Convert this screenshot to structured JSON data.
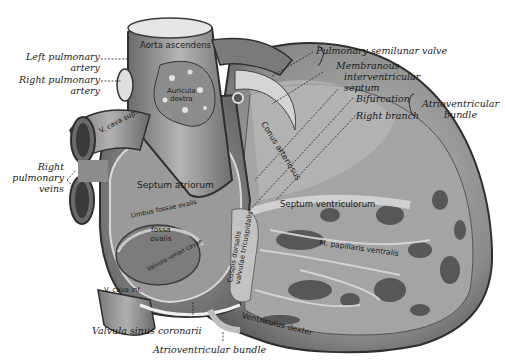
{
  "figure": {
    "colors": {
      "background": "#ffffff",
      "ink": "#1a1a1a",
      "tissue_light": "#c9c9c9",
      "tissue_mid": "#8e8e8e",
      "tissue_dark": "#3c3c3c"
    }
  },
  "external_labels": {
    "left_pulmonary_artery": [
      "Left pulmonary",
      "artery"
    ],
    "right_pulmonary_artery": [
      "Right pulmonary",
      "artery"
    ],
    "right_pulmonary_veins": [
      "Right",
      "pulmonary",
      "veins"
    ],
    "pulmonary_semilunar_valve": "Pulmonary semilunar valve",
    "membranous_interventricular_septum": [
      "Membranous",
      "interventricular",
      "septum"
    ],
    "bifurcation": "Bifurcation",
    "right_branch": "Right branch",
    "atrioventricular_bundle_group": [
      "Atrioventricular",
      "bundle"
    ],
    "valvula_sinus_coronarii": "Valvula sinus coronarii",
    "atrioventricular_bundle": "Atrioventricular bundle"
  },
  "internal_labels": {
    "aorta_ascendens": "Aorta ascendens",
    "auricula_dextra": [
      "Auricula",
      "dextra"
    ],
    "v_cava_superior": "V. cava sup.",
    "septum_atriorum": "Septum atriorum",
    "limbus_fossae_ovalis": "Limbus fossae ovalis",
    "fossa_ovalis": [
      "fossa",
      "ovalis"
    ],
    "valvula_venae_cavae": "Valvula venae cavae",
    "v_cava_inferior": "V. cava inf.",
    "conus_arteriosus": "Conus arteriosus",
    "septum_ventriculorum": "Septum ventriculorum",
    "cuspis_dorsalis": [
      "Cuspis dorsalis",
      "valvulae tricuspidalis"
    ],
    "m_papillaris_ventralis": "M. papillaris ventralis",
    "ventriculus_dexter": "Ventriculus dexter",
    "septal_label": "septal band"
  }
}
